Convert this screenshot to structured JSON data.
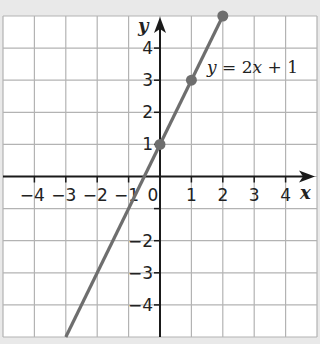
{
  "chart_data": {
    "type": "line",
    "title": "",
    "xlabel": "x",
    "ylabel": "y",
    "xlim": [
      -5,
      5
    ],
    "ylim": [
      -5,
      5
    ],
    "grid": true,
    "x_ticks": [
      -4,
      -3,
      -2,
      -1,
      0,
      1,
      2,
      3,
      4
    ],
    "x_tick_labels": [
      "−4",
      "−3",
      "−2",
      "−1",
      "0",
      "1",
      "2",
      "3",
      "4"
    ],
    "y_ticks": [
      -4,
      -3,
      -2,
      -1,
      1,
      2,
      3,
      4
    ],
    "y_tick_labels": [
      "−4",
      "−3",
      "−2",
      "",
      "1",
      "2",
      "3",
      "4"
    ],
    "series": [
      {
        "name": "y = 2x + 1",
        "equation": "y = 2x + 1",
        "slope": 2,
        "intercept": 1,
        "line_from": {
          "x": -3,
          "y": -5
        },
        "line_to": {
          "x": 2,
          "y": 5
        },
        "marked_points": [
          {
            "x": 0,
            "y": 1
          },
          {
            "x": 1,
            "y": 3
          },
          {
            "x": 2,
            "y": 5
          }
        ],
        "color": "#6e6e6e"
      }
    ],
    "annotations": [
      {
        "text_parts": [
          "y",
          " = 2",
          "x",
          " + 1"
        ],
        "position": "upper right of line near (1,4)"
      }
    ],
    "colors": {
      "background": "#e9e9e9",
      "plot_bg": "#ffffff",
      "grid": "#b3b3b3",
      "axis": "#1a1a1a",
      "line": "#6e6e6e"
    }
  }
}
